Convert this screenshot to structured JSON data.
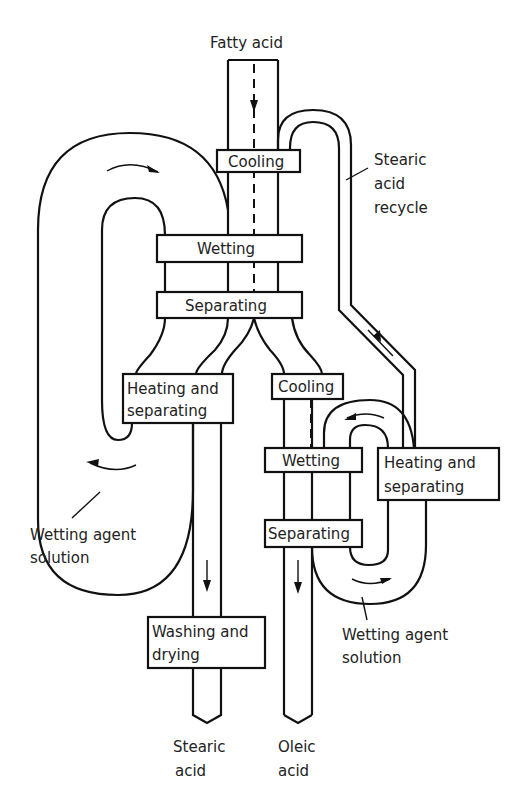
{
  "diagram": {
    "inlet_label": "Fatty acid",
    "recycle_label": [
      "Stearic",
      "acid",
      "recycle"
    ],
    "left_loop": {
      "cooling": "Cooling",
      "wetting": "Wetting",
      "separating": "Separating",
      "heating_separating": [
        "Heating and",
        "separating"
      ],
      "solution_label": [
        "Wetting agent",
        "solution"
      ]
    },
    "right_loop": {
      "cooling": "Cooling",
      "wetting": "Wetting",
      "separating": "Separating",
      "heating_separating": [
        "Heating and",
        "separating"
      ],
      "solution_label": [
        "Wetting agent",
        "solution"
      ]
    },
    "washing": [
      "Washing and",
      "drying"
    ],
    "outlets": {
      "stearic": [
        "Stearic",
        "acid"
      ],
      "oleic": [
        "Oleic",
        "acid"
      ]
    }
  }
}
